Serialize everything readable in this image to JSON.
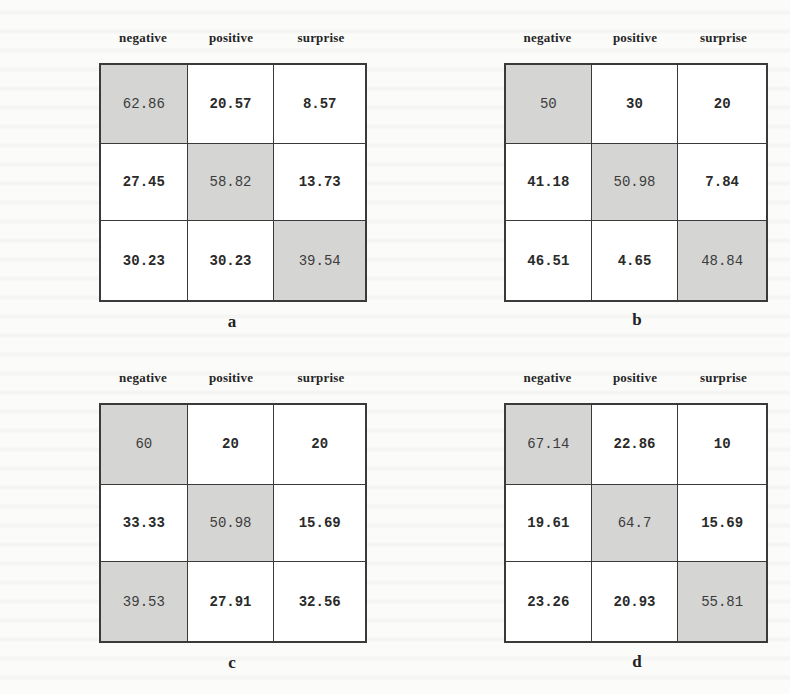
{
  "chart_data": [
    {
      "type": "heatmap",
      "title": "a",
      "row_labels": [
        "negative",
        "positive",
        "surprise"
      ],
      "col_labels": [
        "negative",
        "positive",
        "surprise"
      ],
      "values": [
        [
          62.86,
          20.57,
          8.57
        ],
        [
          27.45,
          58.82,
          13.73
        ],
        [
          30.23,
          30.23,
          39.54
        ]
      ],
      "display": [
        [
          "62.86",
          "20.57",
          "8.57"
        ],
        [
          "27.45",
          "58.82",
          "13.73"
        ],
        [
          "30.23",
          "30.23",
          "39.54"
        ]
      ],
      "highlighted": [
        [
          0,
          0
        ],
        [
          1,
          1
        ],
        [
          2,
          2
        ]
      ]
    },
    {
      "type": "heatmap",
      "title": "b",
      "row_labels": [
        "negative",
        "positive",
        "surprise"
      ],
      "col_labels": [
        "negative",
        "positive",
        "surprise"
      ],
      "values": [
        [
          50,
          30,
          20
        ],
        [
          41.18,
          50.98,
          7.84
        ],
        [
          46.51,
          4.65,
          48.84
        ]
      ],
      "display": [
        [
          "50",
          "30",
          "20"
        ],
        [
          "41.18",
          "50.98",
          "7.84"
        ],
        [
          "46.51",
          "4.65",
          "48.84"
        ]
      ],
      "highlighted": [
        [
          0,
          0
        ],
        [
          1,
          1
        ],
        [
          2,
          2
        ]
      ]
    },
    {
      "type": "heatmap",
      "title": "c",
      "row_labels": [
        "negative",
        "positive",
        "surprise"
      ],
      "col_labels": [
        "negative",
        "positive",
        "surprise"
      ],
      "values": [
        [
          60,
          20,
          20
        ],
        [
          33.33,
          50.98,
          15.69
        ],
        [
          39.53,
          27.91,
          32.56
        ]
      ],
      "display": [
        [
          "60",
          "20",
          "20"
        ],
        [
          "33.33",
          "50.98",
          "15.69"
        ],
        [
          "39.53",
          "27.91",
          "32.56"
        ]
      ],
      "highlighted": [
        [
          0,
          0
        ],
        [
          1,
          1
        ],
        [
          2,
          0
        ]
      ]
    },
    {
      "type": "heatmap",
      "title": "d",
      "row_labels": [
        "negative",
        "positive",
        "surprise"
      ],
      "col_labels": [
        "negative",
        "positive",
        "surprise"
      ],
      "values": [
        [
          67.14,
          22.86,
          10
        ],
        [
          19.61,
          64.7,
          15.69
        ],
        [
          23.26,
          20.93,
          55.81
        ]
      ],
      "display": [
        [
          "67.14",
          "22.86",
          "10"
        ],
        [
          "19.61",
          "64.7",
          "15.69"
        ],
        [
          "23.26",
          "20.93",
          "55.81"
        ]
      ],
      "highlighted": [
        [
          0,
          0
        ],
        [
          1,
          1
        ],
        [
          2,
          2
        ]
      ]
    }
  ],
  "colors": {
    "highlight": "#d5d5d4",
    "cell": "#ffffff",
    "grid": "#3a3a3a",
    "text": "#2a2a2a"
  }
}
